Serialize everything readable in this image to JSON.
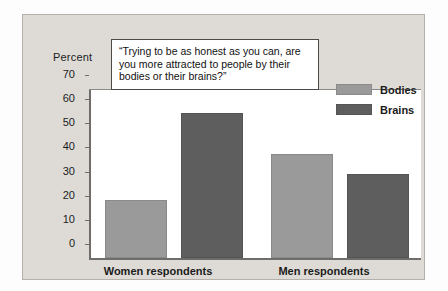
{
  "chart_data": {
    "type": "bar",
    "title": "“Trying to be as honest as you can, are you more attracted to people by their bodies or their brains?”",
    "xlabel": "",
    "ylabel": "Percent",
    "ylim": [
      0,
      70
    ],
    "ytick_values": [
      70,
      60,
      50,
      40,
      30,
      20,
      10,
      0
    ],
    "ytick_labels": [
      "70",
      "60",
      "50",
      "40",
      "30",
      "20",
      "10",
      "0"
    ],
    "grid": true,
    "legend_position": "top-right",
    "categories": [
      "Women respondents",
      "Men respondents"
    ],
    "series": [
      {
        "name": "Bodies",
        "color": "#9a9a9a",
        "values": [
          24,
          43
        ]
      },
      {
        "name": "Brains",
        "color": "#5e5e5e",
        "values": [
          60,
          35
        ]
      }
    ]
  },
  "axis": {
    "percent_label": "Percent",
    "ticks": [
      "70",
      "60",
      "50",
      "40",
      "30",
      "20",
      "10",
      "0"
    ]
  },
  "callout": {
    "text": "“Trying to be as honest as you can, are you more attracted to people by their bodies or their brains?”"
  },
  "legend": {
    "items": [
      {
        "label": "Bodies",
        "color": "#9a9a9a"
      },
      {
        "label": "Brains",
        "color": "#5e5e5e"
      }
    ]
  },
  "categories": [
    {
      "label": "Women respondents"
    },
    {
      "label": "Men respondents"
    }
  ],
  "colors": {
    "panel": "#dedbd7",
    "plot_background": "#ffffff",
    "gridline": "#c9c7c5",
    "axis": "#6f6d6b",
    "bodies": "#9a9a9a",
    "brains": "#5e5e5e"
  }
}
